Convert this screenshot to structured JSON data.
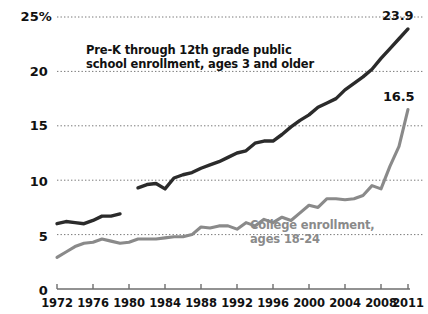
{
  "chart_data": {
    "type": "line",
    "title": "",
    "subtitle": "",
    "xlabel": "",
    "ylabel": "",
    "xlim": [
      1972,
      2011
    ],
    "ylim": [
      0,
      25
    ],
    "grid": true,
    "grid_style": "dotted-horizontal",
    "legend": "inline-annotations",
    "y_ticks": [
      {
        "value": 25,
        "label": "25%"
      },
      {
        "value": 20,
        "label": "20"
      },
      {
        "value": 15,
        "label": "15"
      },
      {
        "value": 10,
        "label": "10"
      },
      {
        "value": 5,
        "label": "5"
      },
      {
        "value": 0,
        "label": "0"
      }
    ],
    "x_ticks": [
      {
        "value": 1972,
        "label": "1972"
      },
      {
        "value": 1976,
        "label": "1976"
      },
      {
        "value": 1980,
        "label": "1980"
      },
      {
        "value": 1984,
        "label": "1984"
      },
      {
        "value": 1988,
        "label": "1988"
      },
      {
        "value": 1992,
        "label": "1992"
      },
      {
        "value": 1996,
        "label": "1996"
      },
      {
        "value": 2000,
        "label": "2000"
      },
      {
        "value": 2004,
        "label": "2004"
      },
      {
        "value": 2008,
        "label": "2008"
      },
      {
        "value": 2011,
        "label": "2011"
      }
    ],
    "series": [
      {
        "name": "Pre-K through 12th grade public school enrollment, ages 3 and older",
        "annotation": "Pre-K through 12th grade public\nschool enrollment, ages 3 and older",
        "annotation_line1": "Pre-K through 12th grade public",
        "annotation_line2": "school enrollment, ages 3 and older",
        "color": "#2b2b2b",
        "end_label": "23.9",
        "segments": [
          {
            "x": [
              1972,
              1973,
              1974,
              1975,
              1976,
              1977,
              1978,
              1979
            ],
            "values": [
              6.0,
              6.2,
              6.1,
              6.0,
              6.3,
              6.7,
              6.7,
              6.9
            ]
          },
          {
            "x": [
              1981,
              1982,
              1983,
              1984,
              1985,
              1986,
              1987,
              1988,
              1989,
              1990,
              1991,
              1992,
              1993,
              1994,
              1995,
              1996,
              1997,
              1998,
              1999,
              2000,
              2001,
              2002,
              2003,
              2004,
              2005,
              2006,
              2007,
              2008,
              2009,
              2010,
              2011
            ],
            "values": [
              9.3,
              9.6,
              9.7,
              9.2,
              10.2,
              10.5,
              10.7,
              11.1,
              11.4,
              11.7,
              12.1,
              12.5,
              12.7,
              13.4,
              13.6,
              13.6,
              14.2,
              14.9,
              15.5,
              16.0,
              16.7,
              17.1,
              17.5,
              18.3,
              18.9,
              19.5,
              20.2,
              21.2,
              22.1,
              23.0,
              23.9
            ]
          }
        ]
      },
      {
        "name": "College enrollment, ages 18-24",
        "annotation": "College enrollment,\nages 18-24",
        "annotation_line1": "College enrollment,",
        "annotation_line2": "ages 18-24",
        "color": "#8a8a8a",
        "end_label": "16.5",
        "segments": [
          {
            "x": [
              1972,
              1973,
              1974,
              1975,
              1976,
              1977,
              1978,
              1979,
              1980,
              1981,
              1982,
              1983,
              1984,
              1985,
              1986,
              1987,
              1988,
              1989,
              1990,
              1991,
              1992,
              1993,
              1994,
              1995,
              1996,
              1997,
              1998,
              1999,
              2000,
              2001,
              2002,
              2003,
              2004,
              2005,
              2006,
              2007,
              2008,
              2009,
              2010,
              2011
            ],
            "values": [
              2.9,
              3.4,
              3.9,
              4.2,
              4.3,
              4.6,
              4.4,
              4.2,
              4.3,
              4.6,
              4.6,
              4.6,
              4.7,
              4.8,
              4.8,
              5.0,
              5.7,
              5.6,
              5.8,
              5.8,
              5.5,
              6.1,
              5.8,
              6.4,
              6.1,
              6.6,
              6.3,
              7.0,
              7.7,
              7.5,
              8.3,
              8.3,
              8.2,
              8.3,
              8.6,
              9.5,
              9.2,
              11.3,
              13.1,
              16.5
            ]
          }
        ]
      }
    ]
  }
}
